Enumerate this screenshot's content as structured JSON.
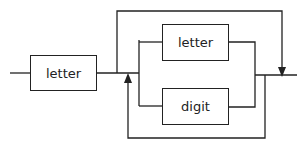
{
  "diagram": {
    "type": "railroad-syntax-diagram",
    "nodes": [
      {
        "id": "n1",
        "label": "letter"
      },
      {
        "id": "n2",
        "label": "letter"
      },
      {
        "id": "n3",
        "label": "digit"
      }
    ],
    "edges": [
      {
        "from": "entry",
        "to": "n1"
      },
      {
        "from": "n1",
        "to": "exit",
        "kind": "bypass"
      },
      {
        "from": "n1",
        "to": "n2",
        "kind": "choice"
      },
      {
        "from": "n1",
        "to": "n3",
        "kind": "choice"
      },
      {
        "from": "n2",
        "to": "exit"
      },
      {
        "from": "n3",
        "to": "exit"
      },
      {
        "from": "choice-end",
        "to": "choice-start",
        "kind": "loop-back"
      }
    ],
    "colors": {
      "line": "#222222",
      "background": "#ffffff"
    }
  }
}
